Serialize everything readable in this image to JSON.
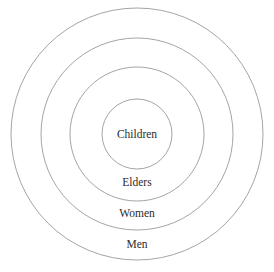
{
  "figure": {
    "type": "concentric-rings",
    "background_color": "#ffffff",
    "stroke_color": "#9a9a9a",
    "text_color": "#2b2b2b",
    "stroke_width": 0.9,
    "center": {
      "x": 137,
      "y": 134
    },
    "canvas": {
      "width": 274,
      "height": 272
    }
  },
  "chart_data": {
    "type": "pie",
    "title": "",
    "xlabel": "",
    "ylabel": "",
    "legend": [],
    "grid": false,
    "categories": [
      "Children",
      "Elders",
      "Women",
      "Men"
    ],
    "values": [
      35,
      67,
      96,
      126
    ],
    "value_units": "radius in pixels",
    "rings": [
      {
        "label": "Children",
        "level": 1,
        "radius": 35,
        "label_x": 137,
        "label_y": 135,
        "font_size": 11.5
      },
      {
        "label": "Elders",
        "level": 2,
        "radius": 67,
        "label_x": 137,
        "label_y": 183,
        "font_size": 11.5
      },
      {
        "label": "Women",
        "level": 3,
        "radius": 96,
        "label_x": 137,
        "label_y": 214,
        "font_size": 11.5
      },
      {
        "label": "Men",
        "level": 4,
        "radius": 126,
        "label_x": 137,
        "label_y": 245,
        "font_size": 11.5
      }
    ]
  }
}
